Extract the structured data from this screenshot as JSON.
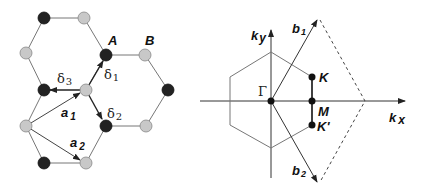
{
  "lattice": {
    "labels": {
      "A": "A",
      "B": "B",
      "delta1": "δ",
      "delta1_sub": "1",
      "delta2": "δ",
      "delta2_sub": "2",
      "delta3": "δ",
      "delta3_sub": "3",
      "a1": "a",
      "a1_sub": "1",
      "a2": "a",
      "a2_sub": "2"
    },
    "colors": {
      "atom_A": "#222222",
      "atom_B": "#c8c8c8",
      "bond": "#777777",
      "vector": "#222222"
    }
  },
  "reciprocal": {
    "labels": {
      "ky": "k",
      "ky_sub": "y",
      "kx": "k",
      "kx_sub": "x",
      "b1": "b",
      "b1_sub": "1",
      "b2": "b",
      "b2_sub": "2",
      "Gamma": "Γ",
      "K": "K",
      "M": "M",
      "Kprime": "K'"
    },
    "colors": {
      "axis": "#333333",
      "hexagon": "#777777",
      "dashed": "#444444",
      "points": "#111111"
    }
  }
}
